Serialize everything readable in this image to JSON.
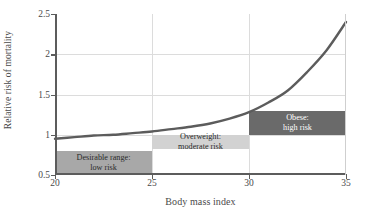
{
  "chart_data": {
    "type": "line",
    "title": "",
    "xlabel": "Body mass index",
    "ylabel": "Relative risk of mortality",
    "xlim": [
      20,
      35
    ],
    "ylim": [
      0.5,
      2.5
    ],
    "xticks": [
      "20",
      "25",
      "30",
      "35"
    ],
    "xtick_values": [
      20,
      25,
      30,
      35
    ],
    "yticks": [
      "0.5",
      "1",
      "1.5",
      "2",
      "2.5"
    ],
    "ytick_values": [
      0.5,
      1,
      1.5,
      2,
      2.5
    ],
    "grid": "horizontal and vertical gridlines at ticks",
    "legend_position": "none",
    "series": [
      {
        "name": "Relative risk of mortality",
        "x": [
          20,
          21,
          22,
          23,
          24,
          25,
          26,
          27,
          28,
          29,
          30,
          31,
          32,
          33,
          34,
          35
        ],
        "values": [
          0.95,
          0.97,
          0.99,
          1.0,
          1.02,
          1.04,
          1.07,
          1.1,
          1.14,
          1.2,
          1.28,
          1.4,
          1.55,
          1.78,
          2.05,
          2.4
        ],
        "color": "#5c5c5c"
      }
    ],
    "annotations": [
      {
        "name": "desirable-range-box",
        "line1": "Desirable range:",
        "line2": "low risk",
        "x_range": [
          20,
          25
        ],
        "y_range": [
          0.5,
          0.8
        ],
        "fill": "#a8a8a8",
        "text_color": "#2b2b2b"
      },
      {
        "name": "overweight-box",
        "line1": "Overweight:",
        "line2": "moderate risk",
        "x_range": [
          25,
          30
        ],
        "y_range": [
          0.82,
          1.0
        ],
        "fill": "#d2d2d2",
        "text_color": "#2b2b2b"
      },
      {
        "name": "obese-box",
        "line1": "Obese:",
        "line2": "high risk",
        "x_range": [
          30,
          35
        ],
        "y_range": [
          1.0,
          1.3
        ],
        "fill": "#6a6a6a",
        "text_color": "#ffffff"
      }
    ]
  }
}
